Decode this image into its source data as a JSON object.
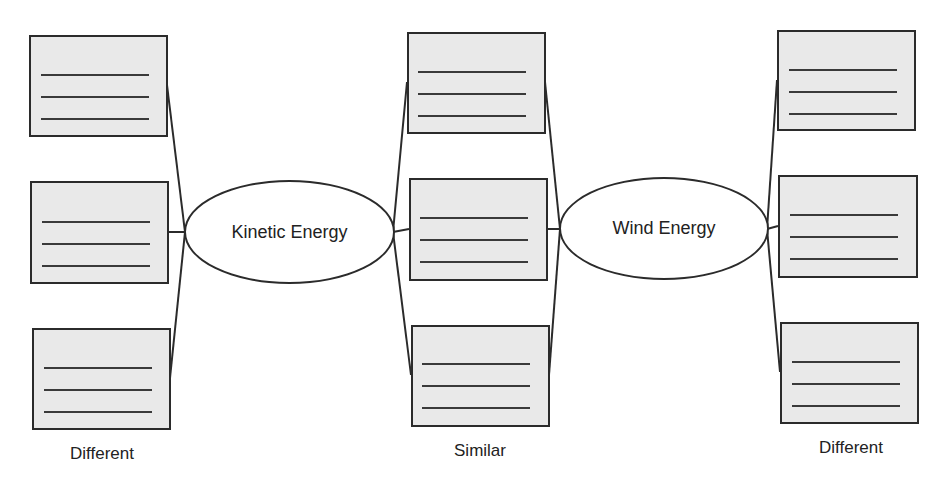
{
  "diagram": {
    "type": "double-bubble-map",
    "colors": {
      "stroke": "#2b2b2b",
      "box_fill": "#e9e9e9",
      "line": "#3a3a3a",
      "background": "#ffffff"
    },
    "center_nodes": [
      {
        "id": "kinetic",
        "label": "Kinetic Energy"
      },
      {
        "id": "wind",
        "label": "Wind Energy"
      }
    ],
    "columns": [
      {
        "id": "left",
        "label": "Different",
        "boxes": [
          {
            "lines": 3
          },
          {
            "lines": 3
          },
          {
            "lines": 3
          }
        ],
        "connected_to": [
          "kinetic"
        ]
      },
      {
        "id": "middle",
        "label": "Similar",
        "boxes": [
          {
            "lines": 3
          },
          {
            "lines": 3
          },
          {
            "lines": 3
          }
        ],
        "connected_to": [
          "kinetic",
          "wind"
        ]
      },
      {
        "id": "right",
        "label": "Different",
        "boxes": [
          {
            "lines": 3
          },
          {
            "lines": 3
          },
          {
            "lines": 3
          }
        ],
        "connected_to": [
          "wind"
        ]
      }
    ]
  }
}
